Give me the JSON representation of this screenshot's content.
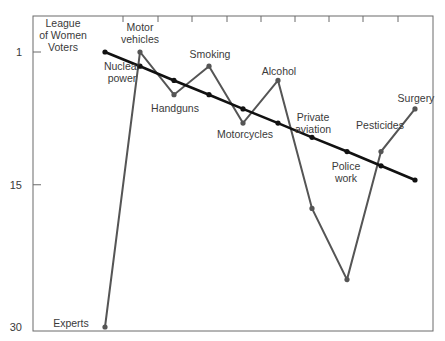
{
  "chart_data": {
    "type": "line",
    "title": "",
    "xlabel": "",
    "ylabel": "",
    "ylim": [
      1,
      30
    ],
    "y_inverted": true,
    "yticks": [
      1,
      15,
      30
    ],
    "grid": false,
    "categories": [
      "Nuclear power",
      "Motor vehicles",
      "Handguns",
      "Smoking",
      "Motorcycles",
      "Alcohol",
      "Private aviation",
      "Police work",
      "Pesticides",
      "Surgery"
    ],
    "series": [
      {
        "name": "League of Women Voters",
        "label": [
          "League",
          "of Women",
          "Voters"
        ],
        "color": "#111111",
        "values": [
          1,
          2.5,
          4,
          5.5,
          7,
          8.5,
          10,
          11.5,
          13,
          14.5
        ]
      },
      {
        "name": "Experts",
        "label": [
          "Experts"
        ],
        "color": "#555555",
        "values": [
          30,
          1,
          5.5,
          2.5,
          8.5,
          4,
          17.5,
          25,
          11.5,
          7
        ]
      }
    ],
    "annotations": [
      {
        "text": [
          "Nuclear",
          "power"
        ],
        "x": 122,
        "y": 70
      },
      {
        "text": [
          "Motor",
          "vehicles"
        ],
        "x": 140,
        "y": 31
      },
      {
        "text": [
          "Handguns"
        ],
        "x": 175,
        "y": 112
      },
      {
        "text": [
          "Smoking"
        ],
        "x": 210,
        "y": 58
      },
      {
        "text": [
          "Motorcycles"
        ],
        "x": 245,
        "y": 138
      },
      {
        "text": [
          "Alcohol"
        ],
        "x": 279,
        "y": 75
      },
      {
        "text": [
          "Private",
          "aviation"
        ],
        "x": 313,
        "y": 121
      },
      {
        "text": [
          "Police",
          "work"
        ],
        "x": 346,
        "y": 170
      },
      {
        "text": [
          "Pesticides"
        ],
        "x": 380,
        "y": 129
      },
      {
        "text": [
          "Surgery"
        ],
        "x": 416,
        "y": 102
      }
    ]
  },
  "layout": {
    "plot": {
      "left": 33,
      "top": 16,
      "right": 433,
      "bottom": 331
    },
    "x_positions": [
      105,
      140,
      174,
      209,
      243,
      278,
      312,
      347,
      381,
      415
    ],
    "y_rank1_px": 52,
    "y_rank30_px": 327,
    "top_tick_x": [
      123,
      158,
      192,
      227,
      261,
      295,
      329,
      363,
      398
    ]
  }
}
